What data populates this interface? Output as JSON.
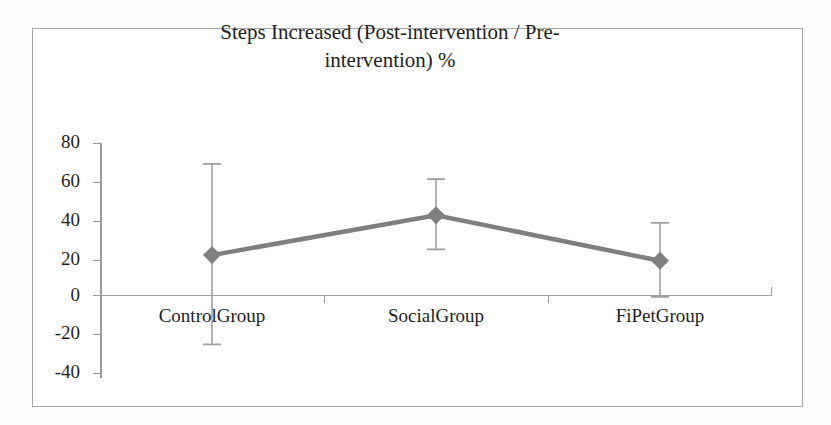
{
  "chart_data": {
    "type": "line",
    "xlabel": "",
    "ylabel": "",
    "categories": [
      "ControlGroup",
      "SocialGroup",
      "FiPetGroup"
    ],
    "values": [
      21,
      42,
      18
    ],
    "error_upper": [
      69,
      61,
      38
    ],
    "error_lower": [
      -26,
      24,
      -1
    ],
    "series": [
      {
        "name": "Steps Increased %",
        "values": [
          21,
          42,
          18
        ],
        "error_upper": [
          69,
          61,
          38
        ],
        "error_lower": [
          -26,
          24,
          -1
        ]
      }
    ],
    "ylim": [
      -40,
      80
    ],
    "yticks": [
      80,
      60,
      40,
      20,
      0,
      -20,
      -40
    ],
    "ytick_labels": [
      "80",
      "60",
      "40",
      "20",
      "0",
      "-20",
      "-40"
    ],
    "grid": false,
    "legend": false,
    "legend_position": "none",
    "marker": "diamond",
    "line_color": "#7f7f7f",
    "marker_color": "#7f7f7f",
    "error_bar_color": "#a0a0a0",
    "axis_color": "#9a9a9a",
    "text_color": "#231f20",
    "background_color": "#ffffff",
    "border_color": "#a9a9a9"
  },
  "title": {
    "line1": "Steps Increased (Post-intervention / Pre-",
    "line2": "intervention) %"
  },
  "axis": {
    "y_labels": [
      "80",
      "60",
      "40",
      "20",
      "0",
      "-20",
      "-40"
    ],
    "x_labels": [
      "ControlGroup",
      "SocialGroup",
      "FiPetGroup"
    ]
  }
}
